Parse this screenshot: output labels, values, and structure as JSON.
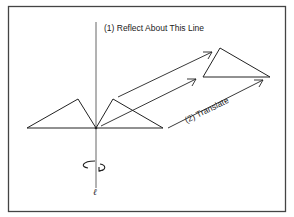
{
  "diagram": {
    "labels": {
      "reflect": "(1)  Reflect About This Line",
      "translate": "(2)  Translate",
      "axis": "ℓ"
    },
    "colors": {
      "stroke": "#222222",
      "background": "#ffffff"
    }
  }
}
